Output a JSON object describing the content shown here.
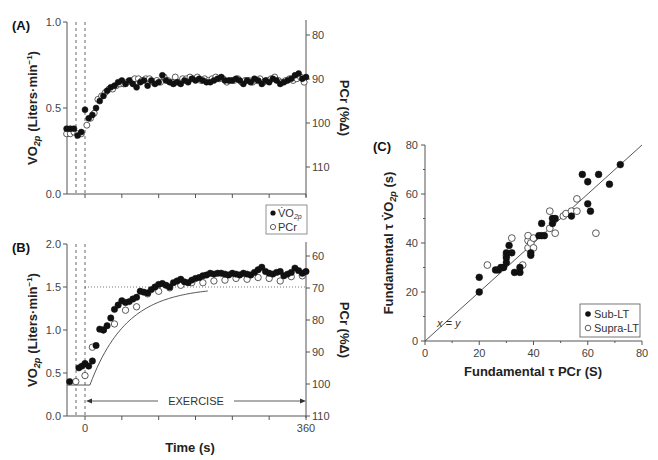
{
  "chart_data": [
    {
      "id": "A",
      "type": "scatter",
      "panel_label": "(A)",
      "title": "",
      "xlabel": "",
      "ylabel": "V̇O2p (Liters·min⁻¹)",
      "ylabel_right": "PCr (%Δ)",
      "xlim": [
        -30,
        360
      ],
      "ylim": [
        0.0,
        1.0
      ],
      "ylim_right": [
        112,
        75
      ],
      "yticks": [
        "0.0",
        "0.5",
        "1.0"
      ],
      "yticks_right": [
        "80",
        "90",
        "100",
        "110"
      ],
      "xticks": [
        0,
        60,
        120,
        180,
        240,
        300,
        360
      ],
      "xtick_labels_visible": false,
      "dashed_vlines": [
        -15,
        0
      ],
      "legend": {
        "position": "lower-right-outside",
        "entries": [
          "V̇O2p",
          "PCr"
        ]
      },
      "series": [
        {
          "name": "V̇O2p",
          "marker": "filled-circle",
          "x": [
            -30,
            -24,
            -18,
            -12,
            -6,
            0,
            6,
            12,
            18,
            24,
            30,
            36,
            42,
            48,
            54,
            60,
            66,
            72,
            78,
            84,
            90,
            96,
            102,
            108,
            114,
            120,
            126,
            132,
            138,
            144,
            150,
            156,
            162,
            168,
            174,
            180,
            186,
            192,
            198,
            204,
            210,
            216,
            222,
            228,
            234,
            240,
            246,
            252,
            258,
            264,
            270,
            276,
            282,
            288,
            294,
            300,
            306,
            312,
            318,
            324,
            330,
            336,
            342,
            348,
            354,
            360
          ],
          "y": [
            0.38,
            0.38,
            0.38,
            0.34,
            0.36,
            0.49,
            0.44,
            0.46,
            0.5,
            0.54,
            0.57,
            0.6,
            0.62,
            0.63,
            0.65,
            0.66,
            0.64,
            0.66,
            0.64,
            0.62,
            0.65,
            0.66,
            0.63,
            0.66,
            0.64,
            0.65,
            0.69,
            0.66,
            0.65,
            0.64,
            0.65,
            0.64,
            0.66,
            0.65,
            0.67,
            0.66,
            0.67,
            0.66,
            0.65,
            0.65,
            0.66,
            0.67,
            0.68,
            0.66,
            0.66,
            0.66,
            0.67,
            0.66,
            0.64,
            0.66,
            0.65,
            0.67,
            0.66,
            0.64,
            0.66,
            0.65,
            0.67,
            0.66,
            0.64,
            0.65,
            0.66,
            0.67,
            0.69,
            0.7,
            0.67,
            0.68
          ]
        },
        {
          "name": "PCr",
          "marker": "open-circle",
          "x": [
            -30,
            -24,
            -18,
            -12,
            -6,
            3,
            9,
            15,
            21,
            27,
            33,
            39,
            45,
            51,
            57,
            63,
            69,
            75,
            81,
            87,
            93,
            99,
            105,
            111,
            117,
            123,
            129,
            135,
            141,
            147,
            153,
            159,
            165,
            171,
            177,
            183,
            189,
            195,
            201,
            207,
            213,
            219,
            225,
            231,
            237,
            243,
            249,
            255,
            261,
            267,
            273,
            279,
            285,
            291,
            297,
            303,
            309,
            315,
            321,
            327,
            333,
            339,
            345,
            351,
            357
          ],
          "y": [
            0.35,
            0.35,
            0.36,
            0.35,
            0.35,
            0.4,
            0.44,
            0.47,
            0.55,
            0.57,
            0.59,
            0.61,
            0.61,
            0.63,
            0.64,
            0.64,
            0.65,
            0.66,
            0.67,
            0.67,
            0.66,
            0.67,
            0.67,
            0.65,
            0.66,
            0.65,
            0.68,
            0.66,
            0.65,
            0.68,
            0.65,
            0.67,
            0.67,
            0.68,
            0.67,
            0.68,
            0.66,
            0.67,
            0.66,
            0.67,
            0.68,
            0.67,
            0.67,
            0.65,
            0.66,
            0.66,
            0.67,
            0.65,
            0.66,
            0.66,
            0.65,
            0.66,
            0.67,
            0.65,
            0.66,
            0.67,
            0.68,
            0.66,
            0.65,
            0.66,
            0.67,
            0.66,
            0.67,
            0.68,
            0.65
          ]
        }
      ]
    },
    {
      "id": "B",
      "type": "scatter",
      "panel_label": "(B)",
      "title": "",
      "xlabel": "Time (s)",
      "ylabel": "V̇O2p (Liters·min⁻¹)",
      "ylabel_right": "PCr (%Δ)",
      "xlim": [
        -30,
        360
      ],
      "ylim": [
        0.0,
        2.0
      ],
      "ylim_right": [
        110,
        55
      ],
      "yticks": [
        "0.0",
        "0.5",
        "1.0",
        "1.5",
        "2.0"
      ],
      "yticks_right": [
        "60",
        "70",
        "80",
        "90",
        "100",
        "110"
      ],
      "xticks": [
        0,
        60,
        120,
        180,
        240,
        300,
        360
      ],
      "xtick_labels": [
        "0",
        "360"
      ],
      "dashed_vlines": [
        -15,
        0
      ],
      "annotation": {
        "text": "EXERCISE",
        "from": 0,
        "to": 360,
        "arrow": "both"
      },
      "fit_line_asymptote": 1.5,
      "baseline": 0.36,
      "series": [
        {
          "name": "V̇O2p",
          "marker": "filled-circle",
          "x": [
            -25,
            -10,
            -5,
            0,
            6,
            12,
            18,
            24,
            30,
            36,
            42,
            48,
            54,
            60,
            66,
            72,
            78,
            84,
            90,
            96,
            102,
            108,
            114,
            120,
            126,
            132,
            138,
            144,
            150,
            156,
            162,
            168,
            174,
            180,
            186,
            192,
            198,
            204,
            210,
            216,
            222,
            228,
            234,
            240,
            246,
            252,
            258,
            264,
            270,
            276,
            282,
            288,
            294,
            300,
            306,
            312,
            318,
            324,
            330,
            336,
            342,
            348,
            354,
            360
          ],
          "y": [
            0.4,
            0.56,
            0.58,
            0.61,
            0.58,
            0.64,
            0.82,
            1.01,
            1.0,
            1.05,
            1.14,
            1.24,
            1.29,
            1.34,
            1.32,
            1.33,
            1.36,
            1.38,
            1.45,
            1.44,
            1.43,
            1.47,
            1.5,
            1.53,
            1.54,
            1.52,
            1.5,
            1.55,
            1.57,
            1.59,
            1.56,
            1.55,
            1.58,
            1.6,
            1.61,
            1.63,
            1.64,
            1.66,
            1.65,
            1.66,
            1.66,
            1.65,
            1.64,
            1.66,
            1.65,
            1.64,
            1.66,
            1.65,
            1.64,
            1.67,
            1.7,
            1.73,
            1.68,
            1.66,
            1.65,
            1.67,
            1.68,
            1.63,
            1.65,
            1.67,
            1.72,
            1.69,
            1.66,
            1.68
          ]
        },
        {
          "name": "PCr",
          "marker": "open-circle",
          "x": [
            -15,
            0,
            12,
            30,
            48,
            66,
            84,
            102,
            120,
            138,
            156,
            174,
            192,
            210,
            228,
            246,
            264,
            282,
            300,
            318,
            336,
            354
          ],
          "y": [
            0.4,
            0.47,
            0.8,
            1.0,
            1.07,
            1.23,
            1.27,
            1.42,
            1.45,
            1.49,
            1.52,
            1.55,
            1.55,
            1.57,
            1.58,
            1.6,
            1.59,
            1.61,
            1.6,
            1.57,
            1.62,
            1.63
          ]
        }
      ]
    },
    {
      "id": "C",
      "type": "scatter",
      "panel_label": "(C)",
      "title": "",
      "xlabel": "Fundamental τ PCr (S)",
      "ylabel": "Fundamental τ V̇O2p (s)",
      "xlim": [
        0,
        80
      ],
      "ylim": [
        0,
        80
      ],
      "xticks": [
        "0",
        "20",
        "40",
        "60",
        "80"
      ],
      "yticks": [
        "0",
        "20",
        "40",
        "60",
        "80"
      ],
      "identity_line_label": "x = y",
      "legend": {
        "position": "lower-right",
        "entries": [
          "Sub-LT",
          "Supra-LT"
        ]
      },
      "series": [
        {
          "name": "Sub-LT",
          "marker": "filled-circle",
          "x": [
            20,
            20,
            26,
            27,
            28,
            29,
            30,
            30,
            30,
            31,
            32,
            33,
            35,
            35,
            39,
            39,
            42,
            43,
            43,
            44,
            47,
            47,
            48,
            54,
            58,
            60,
            60,
            61,
            64,
            68,
            72
          ],
          "y": [
            20,
            26,
            29,
            29,
            30,
            30,
            32,
            34,
            36,
            39,
            36,
            28,
            28,
            30,
            35,
            36,
            43,
            43,
            48,
            43,
            48,
            50,
            50,
            51,
            68,
            65,
            56,
            53,
            68,
            64,
            72
          ]
        },
        {
          "name": "Supra-LT",
          "marker": "open-circle",
          "x": [
            23,
            30,
            32,
            36,
            38,
            38,
            38,
            39,
            40,
            40,
            46,
            46,
            48,
            51,
            52,
            54,
            56,
            56,
            63
          ],
          "y": [
            31,
            35,
            42,
            31,
            38,
            41,
            43,
            40,
            38,
            42,
            46,
            53,
            44,
            51,
            52,
            53,
            58,
            53,
            44
          ]
        }
      ]
    }
  ],
  "labels": {
    "panelA": "(A)",
    "panelB": "(B)",
    "panelC": "(C)",
    "ylabel_vo2": "(Liters·min",
    "ylabel_vo2_sup": "−1",
    "ylabel_vo2_close": ")",
    "vo2_V": "V",
    "vo2_O": "O",
    "vo2_sub": "2p",
    "ylabel_pcr": "PCr (%Δ)",
    "time_label": "Time (s)",
    "exercise": "EXERCISE",
    "legendA_vo2": "V̇O",
    "legendA_vo2_sub": "2p",
    "legendA_pcr": "PCr",
    "c_xlabel": "Fundamental τ PCr (S)",
    "c_ylabel_pre": "Fundamental τ V̇O",
    "c_ylabel_sub": "2p",
    "c_ylabel_post": " (s)",
    "identity": "x = y",
    "legendC_sub": "Sub-LT",
    "legendC_supra": "Supra-LT",
    "tick_0": "0",
    "tick_360": "360"
  },
  "colors": {
    "ink": "#111111",
    "axis": "#555555",
    "tick_text": "#444444",
    "background": "#ffffff"
  }
}
